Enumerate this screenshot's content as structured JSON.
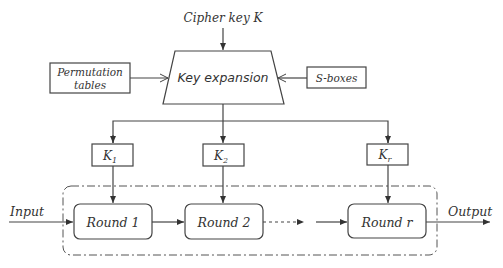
{
  "diagram": {
    "inputs": {
      "cipher_key": "Cipher key K",
      "permutation": [
        "Permutation",
        "tables"
      ],
      "sboxes": "S-boxes"
    },
    "key_expansion": "Key expansion",
    "round_keys": [
      {
        "base": "K",
        "sub": "1"
      },
      {
        "base": "K",
        "sub": "2"
      },
      {
        "base": "K",
        "sub": "r"
      }
    ],
    "rounds": [
      "Round 1",
      "Round 2",
      "Round r"
    ],
    "io": {
      "input": "Input",
      "output": "Output"
    },
    "colors": {
      "stroke": "#444444",
      "text": "#333333",
      "background": "#ffffff"
    }
  }
}
